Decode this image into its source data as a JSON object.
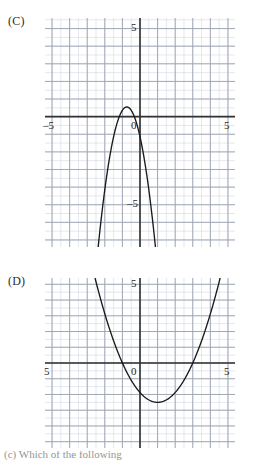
{
  "page": {
    "width": 258,
    "height": 465,
    "background": "#ffffff",
    "colors": {
      "axis": "#333333",
      "major_grid": "#9aa3b0",
      "minor_grid": "#d9dde6",
      "curve": "#1a1a1a",
      "text": "#1f1f1f"
    }
  },
  "panels": [
    {
      "id": "C",
      "label": "(C)",
      "frame": {
        "x": 45,
        "y": 18,
        "width": 190,
        "height": 229
      },
      "ticks": {
        "x_left": "–5",
        "x_right": "5",
        "y_top": "5",
        "y_bottom": "–5",
        "origin": "0"
      },
      "clipped_left_label": false,
      "chart_data": {
        "type": "line",
        "title": "(C)",
        "xlabel": "",
        "ylabel": "",
        "xlim": [
          -5.4,
          5.4
        ],
        "ylim": [
          -7.4,
          5.6
        ],
        "grid": true,
        "minor_grid_step": 0.5,
        "major_grid_step": 1,
        "legend": "none",
        "curve": {
          "name": "downward parabola",
          "direction": "opens-down",
          "vertex": [
            -0.75,
            0.55
          ],
          "roots": [
            -1.7,
            0.1
          ],
          "leading_coefficient": -3.0,
          "equation": "y = -3(x + 0.75)^2 + 0.55",
          "exits": "both arms exit bottom edge"
        }
      }
    },
    {
      "id": "D",
      "label": "(D)",
      "frame": {
        "x": 45,
        "y": 278,
        "width": 190,
        "height": 170
      },
      "ticks": {
        "x_left": "5",
        "x_right": "5",
        "y_top": "5",
        "origin": "0"
      },
      "clipped_left_label": true,
      "chart_data": {
        "type": "line",
        "title": "(D)",
        "xlabel": "",
        "ylabel": "",
        "xlim": [
          -5.4,
          5.4
        ],
        "ylim": [
          -5.4,
          5.4
        ],
        "grid": true,
        "minor_grid_step": 0.5,
        "major_grid_step": 1,
        "legend": "none",
        "curve": {
          "name": "upward parabola",
          "direction": "opens-up",
          "vertex": [
            1.0,
            -2.5
          ],
          "roots": [
            -1.0,
            3.0
          ],
          "leading_coefficient": 0.625,
          "equation": "y = 0.625(x - 1)^2 - 2.5",
          "exits": "both arms exit top edge"
        }
      }
    }
  ],
  "caption": {
    "text": "(c) Which of the following"
  }
}
